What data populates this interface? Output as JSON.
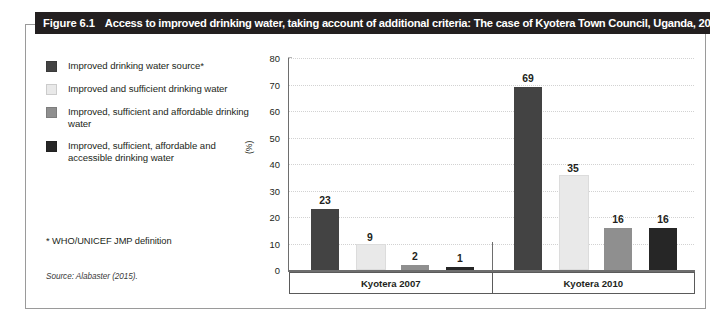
{
  "figure": {
    "number": "Figure 6.1",
    "title": "Access to improved drinking water, taking account of additional criteria: The case of Kyotera Town Council, Uganda, 2007 and 2010",
    "footnote": "* WHO/UNICEF JMP definition",
    "source": "Source: Alabaster (2015)."
  },
  "colors": {
    "title_bar_bg": "#231f20",
    "series_1": "#434343",
    "series_2": "#e9e9e9",
    "series_3": "#8f8f8f",
    "series_4": "#262626",
    "gridline": "#d2d2d2",
    "axis": "#6e6e6e",
    "panel_border": "#9a9a9a"
  },
  "chart_data": {
    "type": "bar",
    "title": "Access to improved drinking water, taking account of additional criteria: The case of Kyotera Town Council, Uganda, 2007 and 2010",
    "xlabel": "",
    "ylabel": "(%)",
    "ylim": [
      0,
      80
    ],
    "yticks": [
      0,
      10,
      20,
      30,
      40,
      50,
      60,
      70,
      80
    ],
    "grid": true,
    "legend_position": "left",
    "categories": [
      "Kyotera 2007",
      "Kyotera 2010"
    ],
    "series": [
      {
        "name": "Improved drinking water source*",
        "color": "#434343",
        "values": [
          23,
          69
        ]
      },
      {
        "name": "Improved and sufficient drinking water",
        "color": "#e9e9e9",
        "values": [
          9,
          35
        ]
      },
      {
        "name": "Improved, sufficient and affordable drinking water",
        "color": "#8f8f8f",
        "values": [
          2,
          16
        ]
      },
      {
        "name": "Improved, sufficient, affordable and accessible drinking water",
        "color": "#262626",
        "values": [
          1,
          16
        ]
      }
    ],
    "data_labels": [
      "23",
      "9",
      "2",
      "1",
      "69",
      "35",
      "16",
      "16"
    ]
  }
}
